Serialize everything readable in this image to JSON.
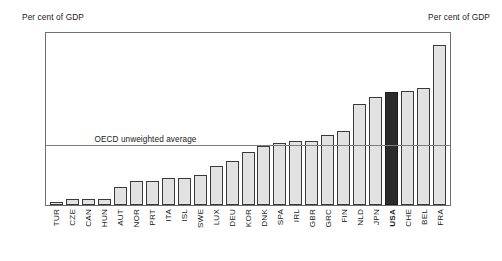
{
  "labels": {
    "unit_left": "Per cent of GDP",
    "unit_right": "Per cent of GDP"
  },
  "annotation": {
    "average_label": "OECD unweighted average",
    "average_value": 0.2
  },
  "axis": {
    "ticks": [
      "0.0",
      "0.1",
      "0.2",
      "0.3",
      "0.4",
      "0.5"
    ]
  },
  "chart_data": {
    "type": "bar",
    "title": "",
    "subtitle": "",
    "xlabel": "",
    "ylabel": "Per cent of GDP",
    "ylim": [
      0.0,
      0.58
    ],
    "yticks": [
      0.0,
      0.1,
      0.2,
      0.3,
      0.4,
      0.5
    ],
    "ytick_labels": [
      "0.0",
      "0.1",
      "0.2",
      "0.3",
      "0.4",
      "0.5"
    ],
    "grid": false,
    "legend": "none",
    "dual_axis": true,
    "categories": [
      "TUR",
      "CZE",
      "CAN",
      "HUN",
      "AUT",
      "NOR",
      "PRT",
      "ITA",
      "ISL",
      "SWE",
      "LUX",
      "DEU",
      "KOR",
      "DNK",
      "SPA",
      "IRL",
      "GBR",
      "GRC",
      "FIN",
      "NLD",
      "JPN",
      "USA",
      "CHE",
      "BEL",
      "FRA"
    ],
    "values": [
      0.01,
      0.02,
      0.02,
      0.02,
      0.06,
      0.08,
      0.08,
      0.09,
      0.09,
      0.1,
      0.13,
      0.15,
      0.18,
      0.2,
      0.21,
      0.215,
      0.215,
      0.235,
      0.25,
      0.34,
      0.365,
      0.38,
      0.385,
      0.395,
      0.54
    ],
    "highlight_category": "USA",
    "highlight_color": "#2b2b2b",
    "bar_color": "#e2e2e2",
    "bar_edge_color": "#3a3a3a",
    "annotations": [
      {
        "type": "hline",
        "value": 0.2,
        "label": "OECD unweighted average"
      }
    ]
  }
}
